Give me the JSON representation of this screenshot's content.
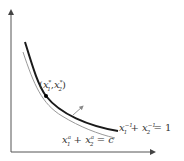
{
  "diagram": {
    "type": "indifference-curve-tangency",
    "axes": {
      "x_label": "",
      "y_label": ""
    },
    "point_label": "(x₁*, x₂*)",
    "point_label_parts": {
      "open": "(",
      "x1": "x",
      "s1": "*",
      "i1": "1",
      "comma": ",",
      "x2": "x",
      "s2": "*",
      "i2": "2",
      "close": ")"
    },
    "curve_label": "x₁⁻¹ + x₂⁻¹ = 1",
    "curve_label_parts": {
      "a": "x",
      "ae": "−1",
      "ai": "1",
      "plus": "+",
      "b": "x",
      "be": "−1",
      "bi": "2",
      "eq": "= 1"
    },
    "line_label": "x₁ᵃ + x₂ᵃ = c",
    "line_label_parts": {
      "a": "x",
      "ae": "a",
      "ai": "1",
      "plus": "+",
      "b": "x",
      "be": "a",
      "bi": "2",
      "eq": "= c"
    },
    "colors": {
      "thick_curve": "#1a1a1a",
      "thin_curve": "#999999",
      "axes": "#555555",
      "arrow": "#888888"
    }
  }
}
